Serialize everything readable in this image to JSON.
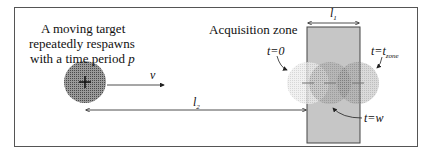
{
  "target_caption": {
    "line1": "A moving target",
    "line2": "repeatedly respawns",
    "line3": "with a time period ",
    "period_symbol": "p"
  },
  "velocity_label": "v",
  "distance_label": "l",
  "distance_sub": "2",
  "zone_label": "Acquisition zone",
  "zone_width_label": "l",
  "zone_width_sub": "1",
  "time_labels": {
    "start": "t=0",
    "end_prefix": "t=t",
    "end_sub": "zone",
    "w": "t=w"
  },
  "colors": {
    "zone_fill": "#c8c8c8",
    "target_fill": "#7a7a7a",
    "frame": "#555555"
  }
}
